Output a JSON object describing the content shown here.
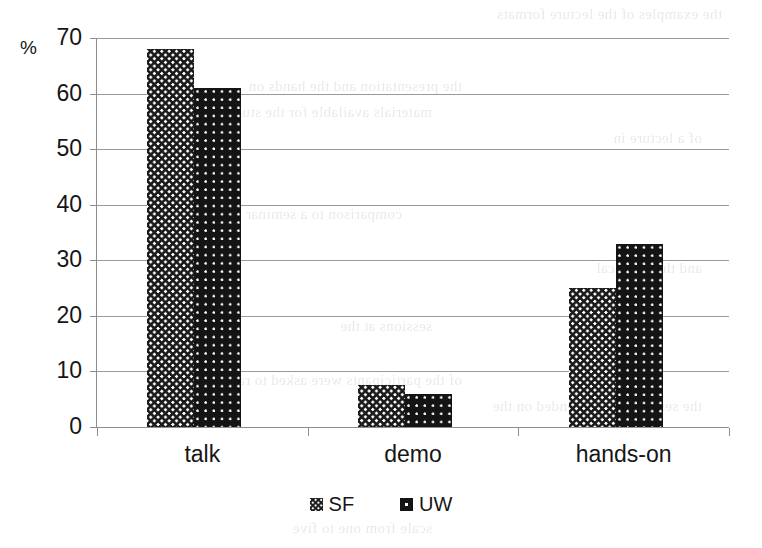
{
  "chart_data": {
    "type": "bar",
    "title": "",
    "xlabel": "",
    "ylabel": "%",
    "ylim": [
      0,
      70
    ],
    "yticks": [
      0,
      10,
      20,
      30,
      40,
      50,
      60,
      70
    ],
    "ytick_labels": [
      "0",
      "10",
      "20",
      "30",
      "40",
      "50",
      "60",
      "70"
    ],
    "grid": true,
    "legend_position": "bottom",
    "categories": [
      "talk",
      "demo",
      "hands-on"
    ],
    "series": [
      {
        "name": "SF",
        "pattern": "checkered-diamond",
        "color": "#1b1b1b",
        "values": [
          68,
          7.5,
          25
        ]
      },
      {
        "name": "UW",
        "pattern": "dark-with-white-dots",
        "color": "#141414",
        "values": [
          61,
          6,
          33
        ]
      }
    ]
  },
  "axis": {
    "percent_symbol": "%"
  },
  "legend": {
    "entries": [
      {
        "label": "SF",
        "swatch": "checkered-swatch-icon"
      },
      {
        "label": "UW",
        "swatch": "dotted-swatch-icon"
      }
    ]
  },
  "scan_artifacts": {
    "lines": [
      "the examples of the lecture formats",
      "the presentation and the hands on",
      "materials available for the students",
      "of a lecture in",
      "comparison to a seminar",
      "and the practical",
      "sessions at the",
      "of the participants were asked to rate",
      "the sessions they attended on the",
      "scale from one to five"
    ]
  }
}
